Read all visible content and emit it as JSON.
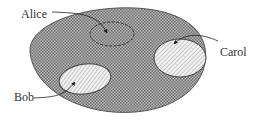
{
  "diagram": {
    "type": "set-membership",
    "container": {
      "name": "universe",
      "fill_pattern": "crosshatch",
      "color": "#8a8a8a"
    },
    "regions": [
      {
        "id": "alice",
        "label": "Alice",
        "fill_pattern": "crosshatch",
        "outline": "dashed"
      },
      {
        "id": "bob",
        "label": "Bob",
        "fill_pattern": "diagonal-hatch",
        "outline": "solid"
      },
      {
        "id": "carol",
        "label": "Carol",
        "fill_pattern": "diagonal-hatch",
        "outline": "solid"
      }
    ]
  },
  "labels": {
    "alice": "Alice",
    "bob": "Bob",
    "carol": "Carol"
  }
}
